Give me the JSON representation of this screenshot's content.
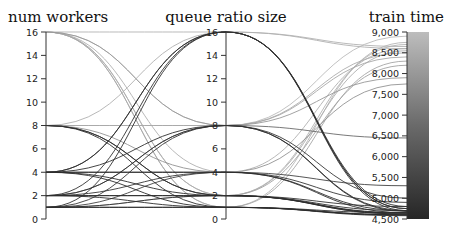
{
  "chart_data": {
    "type": "parallel_coordinates",
    "title": "",
    "dimensions": [
      {
        "label": "num workers",
        "range": [
          0,
          16
        ],
        "ticks": [
          0,
          2,
          4,
          6,
          8,
          10,
          12,
          14,
          16
        ],
        "tick_labels": [
          "0",
          "2",
          "4",
          "6",
          "8",
          "10",
          "12",
          "14",
          "16"
        ]
      },
      {
        "label": "queue ratio size",
        "range": [
          0,
          16
        ],
        "ticks": [
          0,
          2,
          4,
          6,
          8,
          10,
          12,
          14,
          16
        ],
        "tick_labels": [
          "0",
          "2",
          "4",
          "6",
          "8",
          "10",
          "12",
          "14",
          "16"
        ]
      },
      {
        "label": "train time",
        "range": [
          4500,
          9000
        ],
        "ticks": [
          4500,
          5000,
          5500,
          6000,
          6500,
          7000,
          7500,
          8000,
          8500,
          9000
        ],
        "tick_labels": [
          "4,500",
          "5,000",
          "5,500",
          "6,000",
          "6,500",
          "7,000",
          "7,500",
          "8,000",
          "8,500",
          "9,000"
        ]
      }
    ],
    "color_dimension": "train time",
    "colorbar": {
      "min": 4500,
      "max": 9000,
      "low_color": "#2a2a2a",
      "high_color": "#bdbdbd"
    },
    "rows": [
      [
        16,
        16,
        8650
      ],
      [
        16,
        8,
        8900
      ],
      [
        16,
        4,
        8600
      ],
      [
        16,
        2,
        8700
      ],
      [
        16,
        1,
        8750
      ],
      [
        16,
        2,
        8550
      ],
      [
        8,
        16,
        8600
      ],
      [
        8,
        8,
        8500
      ],
      [
        8,
        4,
        7750
      ],
      [
        8,
        2,
        4700
      ],
      [
        8,
        1,
        4650
      ],
      [
        8,
        2,
        4800
      ],
      [
        4,
        16,
        4800
      ],
      [
        4,
        8,
        4700
      ],
      [
        4,
        4,
        4650
      ],
      [
        4,
        2,
        4620
      ],
      [
        4,
        1,
        4600
      ],
      [
        4,
        16,
        4750
      ],
      [
        2,
        16,
        4750
      ],
      [
        2,
        8,
        4680
      ],
      [
        2,
        4,
        4900
      ],
      [
        2,
        2,
        4620
      ],
      [
        2,
        1,
        4600
      ],
      [
        2,
        8,
        6450
      ],
      [
        1,
        16,
        4700
      ],
      [
        1,
        8,
        5000
      ],
      [
        1,
        4,
        5300
      ],
      [
        1,
        2,
        4650
      ],
      [
        1,
        1,
        4600
      ],
      [
        1,
        2,
        8200
      ],
      [
        16,
        1,
        8300
      ],
      [
        8,
        8,
        8400
      ],
      [
        16,
        8,
        7900
      ],
      [
        1,
        1,
        4580
      ],
      [
        2,
        2,
        4640
      ],
      [
        4,
        4,
        4700
      ]
    ]
  }
}
